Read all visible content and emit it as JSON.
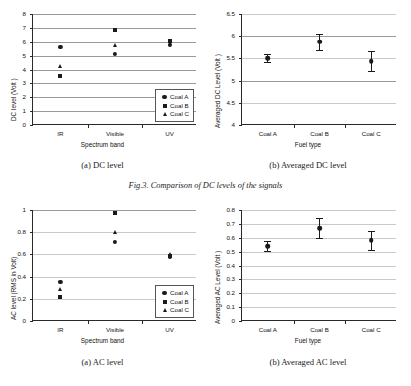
{
  "figure": {
    "caption": "Fig.3. Comparison of DC levels of the signals"
  },
  "panels": {
    "dc_scatter": {
      "subcaption": "(a) DC level",
      "legend": [
        {
          "label": "Coal A",
          "marker": "circle"
        },
        {
          "label": "Coal B",
          "marker": "square"
        },
        {
          "label": "Coal C",
          "marker": "triangle"
        }
      ]
    },
    "dc_avg": {
      "subcaption": "(b) Averaged DC level"
    },
    "ac_scatter": {
      "subcaption": "(a) AC level",
      "legend": [
        {
          "label": "Coal A",
          "marker": "circle"
        },
        {
          "label": "Coal B",
          "marker": "square"
        },
        {
          "label": "Coal C",
          "marker": "triangle"
        }
      ]
    },
    "ac_avg": {
      "subcaption": "(b) Averaged AC level"
    }
  },
  "chart_data": [
    {
      "id": "dc_scatter",
      "type": "scatter",
      "title": "(a) DC level",
      "xlabel": "Spectrum band",
      "ylabel": "DC level  (Volt )",
      "categories": [
        "IR",
        "Visible",
        "UV"
      ],
      "ylim": [
        0,
        8
      ],
      "yticks": [
        0,
        1,
        2,
        3,
        4,
        5,
        6,
        7,
        8
      ],
      "grid": true,
      "legend_position": "lower-right",
      "series": [
        {
          "name": "Coal A",
          "marker": "circle",
          "values": [
            5.6,
            5.1,
            5.75
          ]
        },
        {
          "name": "Coal B",
          "marker": "square",
          "values": [
            3.5,
            6.85,
            6.05
          ]
        },
        {
          "name": "Coal C",
          "marker": "triangle",
          "values": [
            4.25,
            5.75,
            5.9
          ]
        }
      ]
    },
    {
      "id": "dc_avg",
      "type": "scatter",
      "title": "(b) Averaged DC level",
      "xlabel": "Fuel type",
      "ylabel": "Averaged DC Level  (Volt )",
      "categories": [
        "Coal A",
        "Coal B",
        "Coal C"
      ],
      "ylim": [
        4,
        6.5
      ],
      "yticks": [
        4,
        4.5,
        5,
        5.5,
        6,
        6.5
      ],
      "grid": true,
      "values": [
        5.5,
        5.88,
        5.44
      ],
      "errors": [
        0.09,
        0.18,
        0.22
      ]
    },
    {
      "id": "ac_scatter",
      "type": "scatter",
      "title": "(a) AC level",
      "xlabel": "Spectrum band",
      "ylabel": "AC level (RMS in Volt)",
      "categories": [
        "IR",
        "Visible",
        "UV"
      ],
      "ylim": [
        0,
        1
      ],
      "yticks": [
        0,
        0.2,
        0.4,
        0.6,
        0.8,
        1
      ],
      "ytick_labels": [
        "0",
        "0.2",
        "0.4",
        "0.6",
        "0.8",
        "1"
      ],
      "grid": true,
      "legend_position": "lower-right",
      "series": [
        {
          "name": "Coal A",
          "marker": "circle",
          "values": [
            0.35,
            0.715,
            0.575
          ]
        },
        {
          "name": "Coal B",
          "marker": "square",
          "values": [
            0.215,
            0.97,
            0.585
          ]
        },
        {
          "name": "Coal C",
          "marker": "triangle",
          "values": [
            0.285,
            0.8,
            0.6
          ]
        }
      ]
    },
    {
      "id": "ac_avg",
      "type": "scatter",
      "title": "(b) Averaged AC level",
      "xlabel": "Fuel type",
      "ylabel": "Averaged AC Level  (Volt )",
      "categories": [
        "Coal A",
        "Coal B",
        "Coal C"
      ],
      "ylim": [
        0,
        0.8
      ],
      "yticks": [
        0,
        0.1,
        0.2,
        0.3,
        0.4,
        0.5,
        0.6,
        0.7,
        0.8
      ],
      "ytick_labels": [
        "0",
        "0.1",
        "0.2",
        "0.3",
        "0.4",
        "0.5",
        "0.6",
        "0.7",
        "0.8"
      ],
      "grid": true,
      "values": [
        0.54,
        0.67,
        0.583
      ],
      "errors": [
        0.035,
        0.075,
        0.068
      ]
    }
  ]
}
